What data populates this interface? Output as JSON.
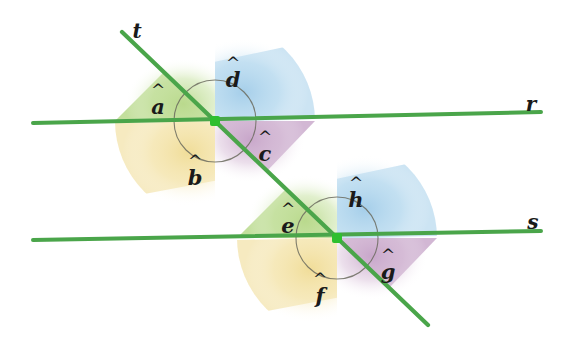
{
  "figure": {
    "kind": "geometry-diagram",
    "width": 574,
    "height": 337,
    "background_color": "#ffffff"
  },
  "colors": {
    "line_green": "#4aa54a",
    "line_green_dark": "#3c8c3c",
    "vertex_dot": "#2fbf2f",
    "arc_stroke": "#5a5a50",
    "sector_green": "#bcd98a",
    "sector_blue": "#a8cfe8",
    "sector_yellow": "#f0dc9a",
    "sector_purple": "#c9a8c9",
    "label_text": "#1a1a1a"
  },
  "lines": [
    {
      "id": "line-r",
      "label": "r",
      "role": "parallel-line-upper",
      "x1": 33,
      "y1": 123,
      "x2": 541,
      "y2": 112,
      "label_x": 531,
      "label_y": 104
    },
    {
      "id": "line-s",
      "label": "s",
      "role": "parallel-line-lower",
      "x1": 33,
      "y1": 240,
      "x2": 541,
      "y2": 231,
      "label_x": 533,
      "label_y": 222
    },
    {
      "id": "line-t",
      "label": "t",
      "role": "transversal",
      "x1": 122,
      "y1": 32,
      "x2": 428,
      "y2": 325,
      "label_x": 137,
      "label_y": 31
    }
  ],
  "vertices": [
    {
      "id": "vertex-upper",
      "x": 215,
      "y": 121,
      "on_lines": [
        "r",
        "t"
      ]
    },
    {
      "id": "vertex-lower",
      "x": 337,
      "y": 238,
      "on_lines": [
        "s",
        "t"
      ]
    }
  ],
  "angles": [
    {
      "id": "angle-a",
      "letter": "a",
      "vertex": "vertex-upper",
      "position": "upper-left",
      "sector_color": "sector_green",
      "label_x": 158,
      "label_y": 101
    },
    {
      "id": "angle-d",
      "letter": "d",
      "vertex": "vertex-upper",
      "position": "upper-right",
      "sector_color": "sector_blue",
      "label_x": 233,
      "label_y": 74
    },
    {
      "id": "angle-c",
      "letter": "c",
      "vertex": "vertex-upper",
      "position": "lower-right",
      "sector_color": "sector_purple",
      "label_x": 265,
      "label_y": 148
    },
    {
      "id": "angle-b",
      "letter": "b",
      "vertex": "vertex-upper",
      "position": "lower-left",
      "sector_color": "sector_yellow",
      "label_x": 195,
      "label_y": 172
    },
    {
      "id": "angle-e",
      "letter": "e",
      "vertex": "vertex-lower",
      "position": "upper-left",
      "sector_color": "sector_green",
      "label_x": 288,
      "label_y": 220
    },
    {
      "id": "angle-h",
      "letter": "h",
      "vertex": "vertex-lower",
      "position": "upper-right",
      "sector_color": "sector_blue",
      "label_x": 356,
      "label_y": 194
    },
    {
      "id": "angle-g",
      "letter": "g",
      "vertex": "vertex-lower",
      "position": "lower-right",
      "sector_color": "sector_purple",
      "label_x": 388,
      "label_y": 266
    },
    {
      "id": "angle-f",
      "letter": "f",
      "vertex": "vertex-lower",
      "position": "lower-left",
      "sector_color": "sector_yellow",
      "label_x": 320,
      "label_y": 290
    }
  ]
}
